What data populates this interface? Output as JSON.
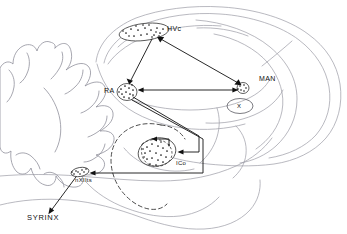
{
  "figure": {
    "background_color": "#ffffff",
    "ink_color": "#111111",
    "outline_color": "#9b9ba5",
    "width": 347,
    "height": 234
  },
  "nuclei": [
    {
      "id": "hvc",
      "label": "HVc",
      "kind": "stippled-nucleus",
      "description": "Higher vocal center, elongate stippled oval in caudal forebrain",
      "label_x": 167,
      "label_y": 31
    },
    {
      "id": "ra",
      "label": "RA",
      "kind": "stippled-nucleus",
      "description": "Robust nucleus of the archistriatum, round stippled nucleus",
      "label_x": 104,
      "label_y": 93
    },
    {
      "id": "man",
      "label": "MAN",
      "kind": "stippled-nucleus",
      "description": "Magnocellular nucleus of the anterior neostriatum",
      "label_x": 259,
      "label_y": 81
    },
    {
      "id": "x",
      "label": "X",
      "kind": "plain-nucleus",
      "description": "Area X of the lobus parolfactorius, plain outlined oval",
      "label_x": 240,
      "label_y": 104
    },
    {
      "id": "ico",
      "label": "ICo",
      "kind": "stippled-nucleus",
      "description": "Nucleus intercollicularis in the midbrain, stippled oval",
      "label_x": 176,
      "label_y": 165
    },
    {
      "id": "nxiits",
      "label": "nXIIts",
      "kind": "stippled-nucleus",
      "description": "Tracheosyringeal portion of the hypoglossal nucleus",
      "label_x": 75,
      "label_y": 182
    },
    {
      "id": "syrinx",
      "label": "SYRINX",
      "kind": "end-organ",
      "description": "Vocal organ, terminal target of the motor pathway",
      "label_x": 27,
      "label_y": 220
    }
  ],
  "pathways": [
    {
      "id": "hvc-to-ra",
      "from": "HVc",
      "to": "RA",
      "arrow": "single",
      "style": "solid"
    },
    {
      "id": "hvc-to-man",
      "from": "HVc",
      "to": "MAN",
      "arrow": "double",
      "style": "solid"
    },
    {
      "id": "man-to-ra",
      "from": "MAN",
      "to": "RA",
      "arrow": "single",
      "style": "solid"
    },
    {
      "id": "ra-to-ico",
      "from": "RA",
      "to": "ICo",
      "arrow": "single",
      "style": "solid-elbow"
    },
    {
      "id": "ra-to-nxiits",
      "from": "RA",
      "to": "nXIIts",
      "arrow": "single",
      "style": "solid-elbow"
    },
    {
      "id": "nxiits-to-syrinx",
      "from": "nXIIts",
      "to": "SYRINX",
      "arrow": "single",
      "style": "solid"
    },
    {
      "id": "ico-internal",
      "from": "ICo",
      "to": "ICo-core",
      "arrow": "single",
      "style": "dashed-loop"
    }
  ],
  "regions": [
    {
      "id": "telencephalon",
      "label": "",
      "description": "Large forebrain mass filling right two thirds of the section"
    },
    {
      "id": "cerebellum",
      "label": "",
      "description": "Foliated cerebellum at left of the section"
    },
    {
      "id": "midbrain-dashed",
      "label": "",
      "description": "Dashed circular boundary marking the midbrain around ICo"
    },
    {
      "id": "brainstem",
      "label": "",
      "description": "Brainstem and medulla extending ventro-caudally"
    }
  ]
}
